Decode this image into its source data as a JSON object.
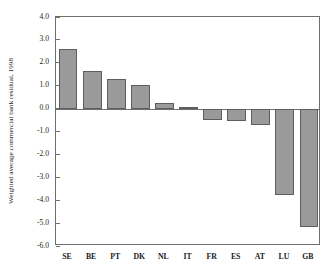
{
  "chart_data": {
    "type": "bar",
    "title": "",
    "xlabel": "",
    "ylabel": "Weighted average commercial bank residual, 1998",
    "categories": [
      "SE",
      "BE",
      "PT",
      "DK",
      "NL",
      "IT",
      "FR",
      "ES",
      "AT",
      "LU",
      "GB"
    ],
    "values": [
      2.62,
      1.65,
      1.28,
      1.05,
      0.25,
      0.07,
      -0.5,
      -0.52,
      -0.72,
      -3.78,
      -5.15
    ],
    "ylim": [
      -6.0,
      4.0
    ],
    "ytick_labels": [
      "4.0",
      "3.0",
      "2.0",
      "1.0",
      "0.0",
      "-1.0",
      "-2.0",
      "-3.0",
      "-4.0",
      "-5.0",
      "-6.0"
    ],
    "ytick_values": [
      4.0,
      3.0,
      2.0,
      1.0,
      0.0,
      -1.0,
      -2.0,
      -3.0,
      -4.0,
      -5.0,
      -6.0
    ],
    "grid": false,
    "legend": null,
    "bar_color": "#9a9a9a",
    "bar_edge_color": "#5e5e5e",
    "axis_color": "#6f6f6f",
    "background": "#ffffff"
  }
}
